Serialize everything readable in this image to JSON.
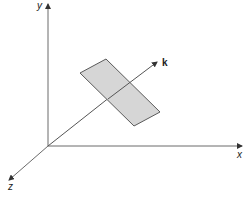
{
  "diagram": {
    "title": "",
    "axes": {
      "x_label": "x",
      "y_label": "y",
      "z_label": "z"
    },
    "vector_label": "k",
    "colors": {
      "axis": "#6b6b6b",
      "plane_fill": "#d6d6d6",
      "plane_stroke": "#5a5a5a",
      "vector": "#555555",
      "label": "#222222"
    }
  }
}
